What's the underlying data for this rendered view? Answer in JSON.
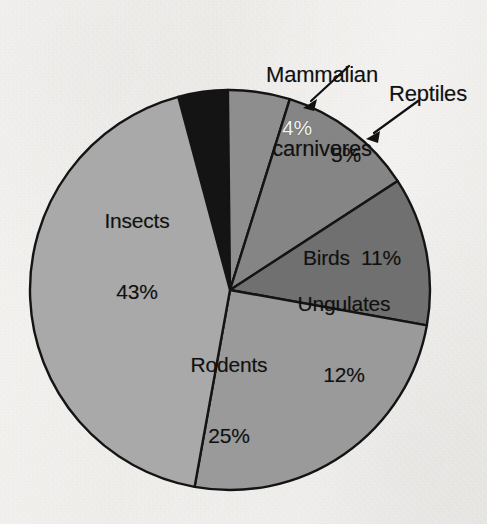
{
  "chart_data": {
    "type": "pie",
    "title": "",
    "subtitle": "",
    "xlabel": "",
    "ylabel": "",
    "legend_position": "none",
    "grid": false,
    "total": 100,
    "units": "%",
    "start_angle_deg": -15,
    "direction": "clockwise",
    "categories": [
      "Mammalian carnivores",
      "Reptiles",
      "Birds",
      "Ungulates",
      "Rodents",
      "Insects"
    ],
    "values": [
      4,
      5,
      11,
      12,
      25,
      43
    ],
    "slices": [
      {
        "label": "Mammalian carnivores",
        "value": 4,
        "value_text": "4%",
        "color": "#141414",
        "label_placement": "outside",
        "label_text_color": "#111111",
        "value_text_color": "#f4f4f4"
      },
      {
        "label": "Reptiles",
        "value": 5,
        "value_text": "5%",
        "color": "#8e8e8e",
        "label_placement": "outside",
        "label_text_color": "#111111",
        "value_text_color": "#111111"
      },
      {
        "label": "Birds",
        "value": 11,
        "value_text": "11%",
        "color": "#858585",
        "label_placement": "inside",
        "label_text_color": "#111111",
        "value_text_color": "#111111"
      },
      {
        "label": "Ungulates",
        "value": 12,
        "value_text": "12%",
        "color": "#707070",
        "label_placement": "inside",
        "label_text_color": "#111111",
        "value_text_color": "#111111"
      },
      {
        "label": "Rodents",
        "value": 25,
        "value_text": "25%",
        "color": "#9a9a9a",
        "label_placement": "inside",
        "label_text_color": "#111111",
        "value_text_color": "#111111"
      },
      {
        "label": "Insects",
        "value": 43,
        "value_text": "43%",
        "color": "#a9a9a9",
        "label_placement": "inside",
        "label_text_color": "#111111",
        "value_text_color": "#111111"
      }
    ]
  },
  "labels": {
    "carnivores_line1": "Mammalian",
    "carnivores_line2": "carnivores",
    "carnivores_value": "4%",
    "reptiles_name": "Reptiles",
    "reptiles_value": "5%",
    "birds_combined": "Birds  11%",
    "ungulates_name": "Ungulates",
    "ungulates_value": "12%",
    "rodents_name": "Rodents",
    "rodents_value": "25%",
    "insects_name": "Insects",
    "insects_value": "43%"
  },
  "colors": {
    "background": "#f2f1ef",
    "outline": "#141414",
    "carnivores": "#141414",
    "reptiles": "#8e8e8e",
    "birds": "#858585",
    "ungulates": "#707070",
    "rodents": "#9a9a9a",
    "insects": "#a9a9a9"
  },
  "geometry": {
    "center_x": 230,
    "center_y": 290,
    "radius": 200
  }
}
